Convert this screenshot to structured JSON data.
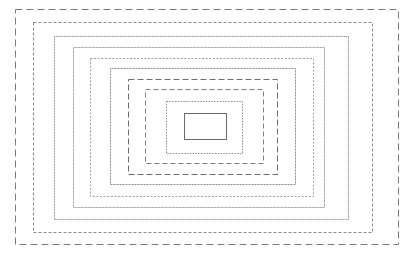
{
  "figure": {
    "canvas": {
      "width": 413,
      "height": 253,
      "background_color": "#ffffff"
    },
    "center": {
      "x": 205,
      "y": 126
    },
    "shape_count": 10,
    "shapes": [
      {
        "index": 1,
        "name": "rectangle-outer-1",
        "stroke_style": "long-dash",
        "x": 15,
        "y": 9,
        "width": 383,
        "height": 235,
        "stroke_color": "#7a7a7a",
        "stroke_width": 1,
        "dash_array": "7 4",
        "fill": "none"
      },
      {
        "index": 2,
        "name": "rectangle-2",
        "stroke_style": "fine-dash-dot",
        "x": 33,
        "y": 22,
        "width": 339,
        "height": 210,
        "stroke_color": "#8a8a8a",
        "stroke_width": 1,
        "dash_array": "3 2",
        "fill": "none"
      },
      {
        "index": 3,
        "name": "rectangle-3",
        "stroke_style": "near-solid",
        "x": 54,
        "y": 36,
        "width": 294,
        "height": 183,
        "stroke_color": "#8f8f8f",
        "stroke_width": 1,
        "dash_array": "1 0.6",
        "fill": "none"
      },
      {
        "index": 4,
        "name": "rectangle-4",
        "stroke_style": "solid-fine",
        "x": 73,
        "y": 47,
        "width": 251,
        "height": 160,
        "stroke_color": "#9a9a9a",
        "stroke_width": 1,
        "dash_array": "1 0.4",
        "fill": "none"
      },
      {
        "index": 5,
        "name": "rectangle-5",
        "stroke_style": "fine-dotted",
        "x": 90,
        "y": 58,
        "width": 223,
        "height": 138,
        "stroke_color": "#a0a0a0",
        "stroke_width": 1,
        "dash_array": "2 1.6",
        "fill": "none"
      },
      {
        "index": 6,
        "name": "rectangle-6",
        "stroke_style": "near-solid",
        "x": 110,
        "y": 68,
        "width": 185,
        "height": 116,
        "stroke_color": "#8a8a8a",
        "stroke_width": 1,
        "dash_array": "1 0.5",
        "fill": "none"
      },
      {
        "index": 7,
        "name": "rectangle-7",
        "stroke_style": "medium-dash",
        "x": 128,
        "y": 79,
        "width": 149,
        "height": 95,
        "stroke_color": "#6e6e6e",
        "stroke_width": 1,
        "dash_array": "6 3",
        "fill": "none"
      },
      {
        "index": 8,
        "name": "rectangle-8",
        "stroke_style": "dash",
        "x": 145,
        "y": 89,
        "width": 118,
        "height": 74,
        "stroke_color": "#808080",
        "stroke_width": 1,
        "dash_array": "5 3",
        "fill": "none"
      },
      {
        "index": 9,
        "name": "rectangle-9",
        "stroke_style": "fine-dotted",
        "x": 166,
        "y": 101,
        "width": 76,
        "height": 52,
        "stroke_color": "#959595",
        "stroke_width": 1,
        "dash_array": "1.6 1.2",
        "fill": "none"
      },
      {
        "index": 10,
        "name": "rectangle-inner-10",
        "stroke_style": "solid",
        "x": 184,
        "y": 113,
        "width": 42,
        "height": 26,
        "stroke_color": "#6a6a6a",
        "stroke_width": 1,
        "dash_array": "none",
        "fill": "#ffffff"
      }
    ]
  }
}
